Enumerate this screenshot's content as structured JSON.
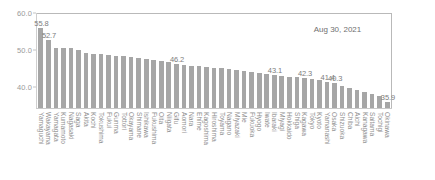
{
  "chart_data": {
    "type": "bar",
    "title": "",
    "subtitle": "",
    "xlabel": "",
    "ylabel": "",
    "ylim": [
      34.2,
      60.0
    ],
    "yticks": [
      "60.0",
      "50.0",
      "40.0"
    ],
    "ytick_values": [
      60.0,
      50.0,
      40.0
    ],
    "grid": false,
    "legend": null,
    "annotations": [
      {
        "text": "Aug 30, 2021",
        "x": 0.78,
        "y": 0.88
      }
    ],
    "bar_color": "#a6a6a6",
    "categories": [
      "Yamaguchi",
      "Wakayama",
      "Yamagata",
      "Kumamoto",
      "Nagasaki",
      "Saga",
      "Akita",
      "Kochi",
      "Tokushima",
      "Fukui",
      "Gunma",
      "Tottori",
      "Okayama",
      "Shimane",
      "Ishikawa",
      "Fukushima",
      "Oita",
      "Niigata",
      "Gifu",
      "Aomori",
      "Nara",
      "Ehime",
      "Kagoshima",
      "Hiroshima",
      "Toyama",
      "Nagano",
      "Miyazaki",
      "Mie",
      "Fukuoka",
      "Hyogo",
      "Iwate",
      "Ibaraki",
      "Miyagi",
      "Hokkaido",
      "Shiga",
      "Kagawa",
      "Tokyo",
      "Kyoto",
      "Yamanashi",
      "Osaka",
      "Shizuoka",
      "Chiba",
      "Aichi",
      "Kanagawa",
      "Saitama",
      "Tochigi",
      "Okinawa"
    ],
    "values": [
      55.8,
      52.7,
      50.6,
      50.5,
      50.4,
      49.9,
      49.2,
      48.9,
      48.8,
      48.6,
      48.4,
      48.2,
      48.0,
      47.9,
      47.5,
      47.2,
      46.9,
      46.6,
      46.2,
      45.9,
      45.7,
      45.6,
      45.4,
      45.2,
      45.0,
      44.7,
      44.5,
      44.3,
      44.0,
      43.7,
      43.4,
      43.1,
      42.9,
      42.7,
      42.5,
      42.3,
      42.0,
      41.7,
      41.4,
      40.9,
      40.3,
      39.6,
      39.2,
      38.6,
      38.0,
      37.4,
      35.9
    ],
    "point_labels": [
      "55.8",
      "52.7",
      "",
      "",
      "",
      "",
      "",
      "",
      "",
      "",
      "",
      "",
      "",
      "",
      "",
      "",
      "",
      "",
      "46.2",
      "",
      "",
      "",
      "",
      "",
      "",
      "",
      "",
      "",
      "",
      "",
      "",
      "43.1",
      "",
      "",
      "",
      "42.3",
      "",
      "",
      "41.4",
      "40.3",
      "",
      "",
      "",
      "",
      "",
      "",
      "35.9"
    ]
  }
}
